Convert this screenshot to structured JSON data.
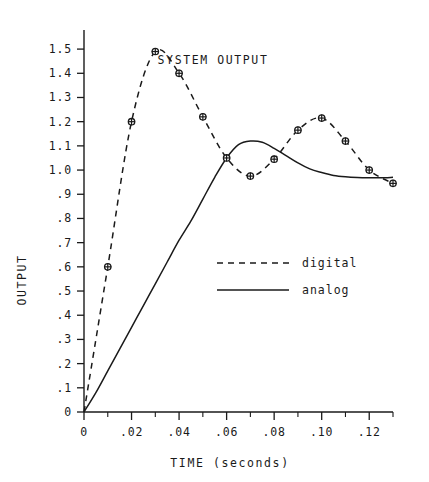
{
  "chart_data": {
    "type": "line",
    "title": "SYSTEM OUTPUT",
    "xlabel": "TIME  (seconds)",
    "ylabel": "OUTPUT",
    "xlim": [
      0,
      0.13
    ],
    "ylim": [
      0,
      1.55
    ],
    "grid": false,
    "legend_position": "center-right-inside",
    "x_tick_labels": [
      "0",
      ".02",
      ".04",
      ".06",
      ".08",
      ".10",
      ".12"
    ],
    "x_tick_values": [
      0,
      0.02,
      0.04,
      0.06,
      0.08,
      0.1,
      0.12
    ],
    "x_minor_tick_values": [
      0.01,
      0.03,
      0.05,
      0.07,
      0.09,
      0.11,
      0.13
    ],
    "y_tick_labels": [
      "0",
      ".1",
      ".2",
      ".3",
      ".4",
      ".5",
      ".6",
      ".7",
      ".8",
      ".9",
      "1.0",
      "1.1",
      "1.2",
      "1.3",
      "1.4",
      "1.5"
    ],
    "y_tick_values": [
      0,
      0.1,
      0.2,
      0.3,
      0.4,
      0.5,
      0.6,
      0.7,
      0.8,
      0.9,
      1.0,
      1.1,
      1.2,
      1.3,
      1.4,
      1.5
    ],
    "series": [
      {
        "name": "digital",
        "style": "dashed",
        "markers": true,
        "x": [
          0,
          0.01,
          0.02,
          0.03,
          0.04,
          0.05,
          0.06,
          0.07,
          0.08,
          0.09,
          0.1,
          0.11,
          0.12,
          0.13
        ],
        "values": [
          0,
          0.6,
          1.2,
          1.49,
          1.4,
          1.22,
          1.05,
          0.975,
          1.045,
          1.165,
          1.215,
          1.12,
          1.0,
          0.945
        ]
      },
      {
        "name": "analog",
        "style": "solid",
        "markers": false,
        "x": [
          0,
          0.005,
          0.01,
          0.015,
          0.02,
          0.025,
          0.03,
          0.035,
          0.04,
          0.045,
          0.05,
          0.055,
          0.06,
          0.065,
          0.07,
          0.075,
          0.08,
          0.085,
          0.09,
          0.095,
          0.1,
          0.105,
          0.11,
          0.115,
          0.12,
          0.125,
          0.13
        ],
        "values": [
          0,
          0.08,
          0.17,
          0.26,
          0.35,
          0.44,
          0.53,
          0.62,
          0.71,
          0.79,
          0.88,
          0.97,
          1.05,
          1.105,
          1.12,
          1.115,
          1.09,
          1.06,
          1.03,
          1.005,
          0.99,
          0.978,
          0.972,
          0.969,
          0.968,
          0.968,
          0.97
        ]
      }
    ],
    "legend_entries": [
      {
        "label": "digital",
        "style": "dashed"
      },
      {
        "label": "analog",
        "style": "solid"
      }
    ]
  }
}
